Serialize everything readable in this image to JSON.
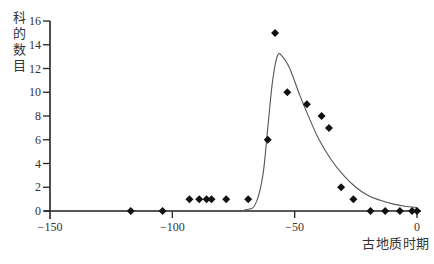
{
  "chart_data": {
    "type": "scatter",
    "title": "",
    "xlabel": "古地质时期",
    "ylabel": "科的数目",
    "xlim": [
      -150,
      0
    ],
    "ylim": [
      0,
      16
    ],
    "x_ticks": [
      -150,
      -100,
      -50,
      0
    ],
    "x_tick_labels": [
      "−150",
      "−100",
      "−50",
      "0"
    ],
    "y_ticks": [
      0,
      2,
      4,
      6,
      8,
      10,
      12,
      14,
      16
    ],
    "y_tick_labels": [
      "0",
      "2",
      "4",
      "6",
      "8",
      "10",
      "12",
      "14",
      "16"
    ],
    "grid": false,
    "legend": null,
    "series": [
      {
        "name": "observed",
        "kind": "scatter",
        "marker": "diamond",
        "color": "#111111",
        "x": [
          -117,
          -104,
          -93,
          -89,
          -86,
          -84,
          -78,
          -69,
          -61,
          -58,
          -53,
          -45,
          -39,
          -36,
          -31,
          -26,
          -19,
          -13,
          -7,
          -2,
          0
        ],
        "y": [
          0,
          0,
          1,
          1,
          1,
          1,
          1,
          1,
          6,
          15,
          10,
          9,
          8,
          7,
          2,
          1,
          0,
          0,
          0,
          0,
          0
        ]
      },
      {
        "name": "fitted curve",
        "kind": "line",
        "color": "#555555",
        "x": [
          -150,
          -80,
          -70,
          -66,
          -63,
          -61,
          -59,
          -57,
          -55,
          -52,
          -48,
          -44,
          -40,
          -35,
          -30,
          -25,
          -20,
          -15,
          -10,
          -5,
          0
        ],
        "y": [
          0,
          0,
          0.1,
          0.6,
          3,
          7,
          11,
          13.1,
          13.0,
          12.0,
          9.8,
          7.8,
          6.0,
          4.3,
          3.0,
          2.0,
          1.3,
          0.9,
          0.6,
          0.4,
          0.3
        ]
      }
    ]
  }
}
